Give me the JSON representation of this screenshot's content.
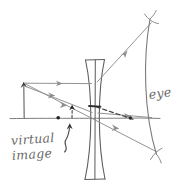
{
  "figure": {
    "type": "ray-optics-diagram",
    "background_color": "#ffffff",
    "ink_color": "#6b6b6b",
    "dark_ink_color": "#3a3a3a"
  },
  "labels": {
    "eye": "eye",
    "virtual": "virtual",
    "image": "image"
  },
  "elements": {
    "optical_axis": "optical-axis",
    "lens": "biconcave-diverging-lens",
    "object_arrow": "object-arrow",
    "virtual_image_arrow": "virtual-image-arrow",
    "eye_arc": "eye-arc",
    "pointer": "curly-pointer-arrow"
  },
  "geometry": {
    "axis_y": 118,
    "lens_center_x": 95,
    "lens_top_y": 59,
    "lens_bottom_y": 180,
    "object_base": [
      24,
      118
    ],
    "object_tip": [
      24,
      83
    ],
    "virtual_image_base": [
      72,
      118
    ],
    "virtual_image_tip": [
      72,
      106
    ],
    "focal_point_left": [
      58,
      118
    ],
    "focal_point_right": [
      130,
      118
    ],
    "eye_arc_top": [
      152,
      16
    ],
    "eye_arc_bottom": [
      158,
      158
    ]
  },
  "rays": [
    {
      "name": "parallel-ray-incident",
      "style": "solid",
      "from": [
        24,
        83
      ],
      "to": [
        95,
        83
      ],
      "arrow_at": 0.62
    },
    {
      "name": "parallel-ray-refracted-diverging",
      "style": "solid",
      "from": [
        95,
        83
      ],
      "to": [
        152,
        22
      ],
      "arrow_at": 0.55
    },
    {
      "name": "virtual-extension-back-to-image",
      "style": "solid",
      "from": [
        95,
        83
      ],
      "to": [
        24,
        83
      ]
    },
    {
      "name": "chief-ray-through-center",
      "style": "solid",
      "from": [
        24,
        83
      ],
      "to": [
        158,
        152
      ],
      "arrow_at": 0.38
    },
    {
      "name": "secondary-ray",
      "style": "solid",
      "from": [
        24,
        85
      ],
      "to": [
        95,
        111
      ],
      "arrow_at": 0.55
    },
    {
      "name": "secondary-ray-refracted",
      "style": "solid",
      "from": [
        95,
        111
      ],
      "to": [
        152,
        118
      ],
      "arrow_at": 0.6
    },
    {
      "name": "virtual-ray-dashed",
      "style": "dashed",
      "from": [
        95,
        107
      ],
      "to": [
        133,
        119
      ]
    },
    {
      "name": "virtual-construction-to-image-tip",
      "style": "dashed",
      "from": [
        72,
        106
      ],
      "to": [
        72,
        118
      ]
    }
  ],
  "markers": {
    "dots": [
      [
        58,
        118
      ],
      [
        72,
        106
      ],
      [
        130,
        118
      ]
    ]
  }
}
